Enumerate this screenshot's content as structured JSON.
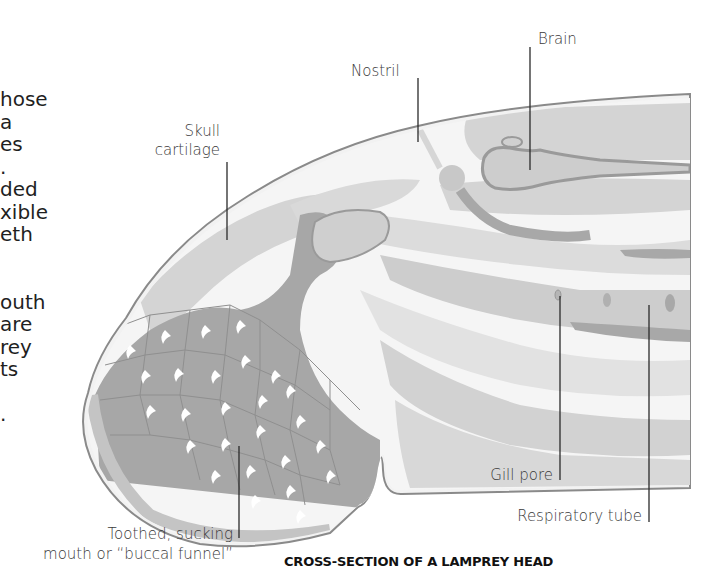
{
  "body_text": {
    "lines": [
      "hose",
      "a",
      "es",
      ".",
      "ded",
      "xible",
      "eth",
      "",
      "",
      "outh",
      "are",
      "rey",
      "ts",
      "",
      "."
    ]
  },
  "diagram": {
    "caption": "CROSS-SECTION OF A LAMPREY HEAD",
    "labels": {
      "brain": "Brain",
      "nostril": "Nostril",
      "skull_cartilage_line1": "Skull",
      "skull_cartilage_line2": "cartilage",
      "gill_pore": "Gill pore",
      "respiratory_tube": "Respiratory tube",
      "mouth_line1": "Toothed, sucking",
      "mouth_line2": "mouth or “buccal funnel”"
    },
    "colors": {
      "outline": "#8a8a8a",
      "light_tissue": "#d6d6d6",
      "lighter_tissue": "#e4e4e4",
      "mid_tissue": "#bdbdbd",
      "dark_tissue": "#a3a3a3",
      "background_gap": "#f4f4f4",
      "tooth": "#ffffff"
    }
  }
}
